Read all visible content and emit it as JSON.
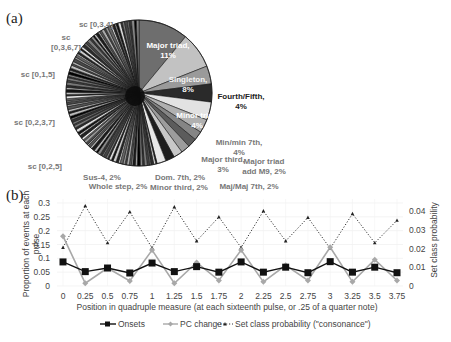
{
  "panels": {
    "a": "(a)",
    "b": "(b)"
  },
  "chart_data": [
    {
      "type": "pie",
      "panel": "(a)",
      "title": "",
      "labeled_slices": [
        {
          "label": "Major triad, 11%",
          "value": 11,
          "color": "#6e6e6e",
          "text_color": "#ffffff"
        },
        {
          "label": "Singleton, 8%",
          "value": 8,
          "color": "#c2c2c2",
          "text_color": "#ffffff"
        },
        {
          "label": "Fourth/Fifth, 4%",
          "value": 4,
          "color": "#9a9a9a",
          "text_color": "#222222"
        },
        {
          "label": "Minor triad, 4%",
          "value": 4,
          "color": "#2a2a2a",
          "text_color": "#ffffff"
        },
        {
          "label": "Min/min 7th, 4%",
          "value": 4,
          "color": "#e2e2e2",
          "text_color": "#777777"
        },
        {
          "label": "Major third, 3%",
          "value": 3,
          "color": "#b0b0b0",
          "text_color": "#777777"
        },
        {
          "label": "Major triad add M9, 2%",
          "value": 2,
          "color": "#858585",
          "text_color": "#777777"
        },
        {
          "label": "Maj/Maj 7th, 2%",
          "value": 2,
          "color": "#5c5c5c",
          "text_color": "#777777"
        },
        {
          "label": "Minor third, 2%",
          "value": 2,
          "color": "#9c9c9c",
          "text_color": "#777777"
        },
        {
          "label": "Dom. 7th, 2%",
          "value": 2,
          "color": "#c8c8c8",
          "text_color": "#777777"
        },
        {
          "label": "Whole step, 2%",
          "value": 2,
          "color": "#1e1e1e",
          "text_color": "#777777"
        },
        {
          "label": "Sus-4, 2%",
          "value": 2,
          "color": "#e8e8e8",
          "text_color": "#777777"
        }
      ],
      "other_slices_note": "Many small unlabeled slices (remaining ~54%)",
      "side_labels": [
        "sc [0,3,4]",
        "sc [0,3,6,7]",
        "sc [0,1,5]",
        "sc [0,2,3,7]",
        "sc [0,2,5]"
      ]
    },
    {
      "type": "line",
      "panel": "(b)",
      "title": "",
      "xlabel": "Position in quadruple measure (at each sixteenth pulse, or .25 of a quarter note)",
      "ylabel": "Proportion of events at each pulse",
      "y2label": "Set class probability",
      "x": [
        "0",
        "0.25",
        "0.5",
        "0.75",
        "1",
        "1.25",
        "1.5",
        "1.75",
        "2",
        "2.25",
        "2.5",
        "2.75",
        "3",
        "3.25",
        "3.5",
        "3.75"
      ],
      "ylim": [
        0,
        0.3
      ],
      "yticks": [
        "0",
        "0.05",
        "0.1",
        "0.15",
        "0.2",
        "0.25",
        "0.3"
      ],
      "y2lim": [
        0,
        0.04
      ],
      "y2ticks": [
        "0",
        "0.01",
        "0.02",
        "0.03",
        "0.04"
      ],
      "grid": true,
      "legend_position": "bottom",
      "series": [
        {
          "name": "Onsets",
          "axis": "left",
          "color": "#111111",
          "marker": "square",
          "values": [
            0.087,
            0.052,
            0.065,
            0.047,
            0.083,
            0.052,
            0.07,
            0.05,
            0.087,
            0.05,
            0.068,
            0.048,
            0.088,
            0.05,
            0.068,
            0.048
          ]
        },
        {
          "name": "PC change",
          "axis": "left",
          "color": "#a8a8a8",
          "marker": "diamond",
          "values": [
            0.18,
            0.01,
            0.065,
            0.018,
            0.13,
            0.01,
            0.085,
            0.02,
            0.13,
            0.015,
            0.075,
            0.02,
            0.14,
            0.015,
            0.095,
            0.02
          ]
        },
        {
          "name": "Set class probability (\"consonance\")",
          "axis": "right",
          "color": "#333333",
          "marker": "triangle",
          "line": "dotted",
          "values": [
            0.0205,
            0.0427,
            0.023,
            0.0395,
            0.0203,
            0.0421,
            0.024,
            0.0368,
            0.0205,
            0.04,
            0.024,
            0.0365,
            0.02,
            0.0385,
            0.023,
            0.035
          ]
        }
      ]
    }
  ],
  "legend": {
    "onsets": "Onsets",
    "pc_change": "PC change",
    "set_class": "Set class probability (\"consonance\")"
  }
}
